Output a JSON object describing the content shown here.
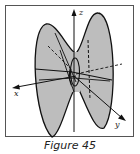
{
  "figure": {
    "caption": "Figure 45",
    "axes": {
      "x_label": "x",
      "y_label": "y",
      "z_label": "z"
    },
    "colors": {
      "surface_fill": "#bdbdbd",
      "line": "#111111",
      "frame": "#555555"
    }
  }
}
